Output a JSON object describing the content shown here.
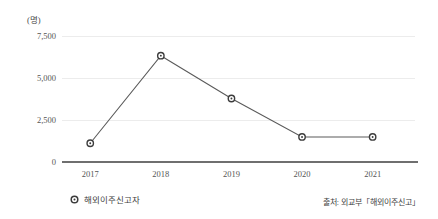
{
  "unit_label": "(명)",
  "legend": {
    "marker_icon": "circle-marker-icon",
    "label": "해외이주신고자"
  },
  "source": {
    "text": "출처: 외교부「해외이주신고」"
  },
  "chart_data": {
    "type": "line",
    "title": "",
    "subtitle": "",
    "xlabel": "",
    "ylabel": "(명)",
    "categories": [
      "2017",
      "2018",
      "2019",
      "2020",
      "2021"
    ],
    "series": [
      {
        "name": "해외이주신고자",
        "values": [
          1117,
          6330,
          3780,
          1490,
          1490
        ]
      }
    ],
    "ylim": [
      0,
      7500
    ],
    "yticks": [
      0,
      2500,
      5000,
      7500
    ],
    "ytick_labels": [
      "0",
      "2,500",
      "5,000",
      "7,500"
    ],
    "grid": true,
    "grid_axis": "y",
    "legend_position": "bottom-left",
    "marker": "open-circle",
    "line_color": "#5a5a5a",
    "marker_edge_color": "#3c3c3c",
    "marker_face_color": "#ffffff",
    "gridline_color": "#ececec",
    "axis_color": "#6f6f6f",
    "annotations": [
      "출처: 외교부「해외이주신고」"
    ]
  }
}
